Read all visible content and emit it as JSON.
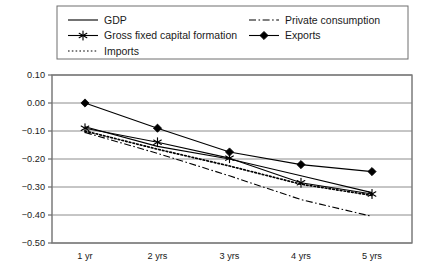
{
  "chart_data": {
    "type": "line",
    "title": "",
    "subtitle": "",
    "xlabel": "",
    "ylabel": "",
    "categories": [
      "1 yr",
      "2 yrs",
      "3 yrs",
      "4 yrs",
      "5 yrs"
    ],
    "ylim": [
      -0.5,
      0.1
    ],
    "ytick_labels": [
      "0.10",
      "0.00",
      "-0.10",
      "-0.20",
      "-0.30",
      "-0.40",
      "-0.50"
    ],
    "ytick_values": [
      0.1,
      0.0,
      -0.1,
      -0.2,
      -0.3,
      -0.4,
      -0.5
    ],
    "grid": true,
    "grid_axis": "y",
    "legend_position": "top",
    "series": [
      {
        "name": "GDP",
        "style": "solid",
        "marker": "none",
        "color": "#000000",
        "values": [
          -0.085,
          -0.155,
          -0.2,
          -0.26,
          -0.32
        ]
      },
      {
        "name": "Gross fixed capital formation",
        "style": "solid",
        "marker": "star",
        "color": "#000000",
        "values": [
          -0.09,
          -0.14,
          -0.197,
          -0.285,
          -0.325
        ]
      },
      {
        "name": "Imports",
        "style": "dotted",
        "marker": "none",
        "color": "#000000",
        "values": [
          -0.1,
          -0.165,
          -0.225,
          -0.29,
          -0.33
        ]
      },
      {
        "name": "Private consumption",
        "style": "dashdot",
        "marker": "none",
        "color": "#000000",
        "values": [
          -0.105,
          -0.18,
          -0.26,
          -0.345,
          -0.405
        ]
      },
      {
        "name": "Exports",
        "style": "solid",
        "marker": "diamond",
        "color": "#000000",
        "values": [
          0.0,
          -0.09,
          -0.175,
          -0.22,
          -0.245
        ]
      }
    ]
  },
  "legend": {
    "col1": [
      {
        "label": "GDP",
        "style": "solid",
        "marker": "none"
      },
      {
        "label": "Gross fixed capital formation",
        "style": "solid",
        "marker": "star"
      },
      {
        "label": "Imports",
        "style": "dotted",
        "marker": "none"
      }
    ],
    "col2": [
      {
        "label": "Private consumption",
        "style": "dashdot",
        "marker": "none"
      },
      {
        "label": "Exports",
        "style": "solid",
        "marker": "diamond"
      }
    ]
  },
  "axes": {
    "ytick_labels": [
      "0.10",
      "0.00",
      "-0.10",
      "-0.20",
      "-0.30",
      "-0.40",
      "-0.50"
    ],
    "xtick_labels": [
      "1 yr",
      "2 yrs",
      "3 yrs",
      "4 yrs",
      "5 yrs"
    ]
  },
  "colors": {
    "line": "#000000",
    "grid": "#808080",
    "frame": "#7a7a7a",
    "background": "#ffffff"
  }
}
